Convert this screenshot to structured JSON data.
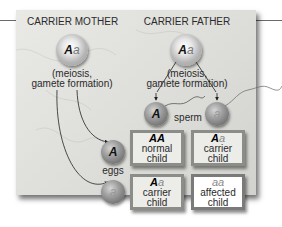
{
  "diagram": {
    "mother": {
      "title": "CARRIER MOTHER",
      "genotype_dominant": "A",
      "genotype_recessive": "a",
      "process_line1": "(meiosis,",
      "process_line2": "gamete formation)"
    },
    "father": {
      "title": "CARRIER FATHER",
      "genotype_dominant": "A",
      "genotype_recessive": "a",
      "process_line1": "(meiosis,",
      "process_line2": "gamete formation)"
    },
    "gametes": {
      "sperm_label": "sperm",
      "eggs_label": "eggs",
      "sperm": [
        "A",
        "a"
      ],
      "eggs": [
        "A",
        "a"
      ]
    },
    "punnett": [
      {
        "allele1": "A",
        "allele2": "A",
        "line1": "normal",
        "line2": "child",
        "highlight": false
      },
      {
        "allele1": "A",
        "allele2": "a",
        "line1": "carrier",
        "line2": "child",
        "highlight": false
      },
      {
        "allele1": "A",
        "allele2": "a",
        "line1": "carrier",
        "line2": "child",
        "highlight": false
      },
      {
        "allele1": "a",
        "allele2": "a",
        "line1": "affected",
        "line2": "child",
        "highlight": true
      }
    ]
  }
}
